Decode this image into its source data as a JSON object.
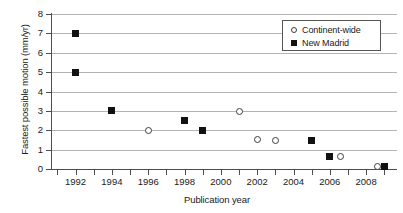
{
  "chart_data": {
    "type": "scatter",
    "title": "",
    "xlabel": "Publication year",
    "ylabel": "Fastest possible motion (mm/yr)",
    "xlim": [
      1990.7,
      2009.7
    ],
    "ylim": [
      0,
      8
    ],
    "grid": true,
    "legend_position": "top-right",
    "y_ticks": [
      0,
      1,
      2,
      3,
      4,
      5,
      6,
      7,
      8
    ],
    "y_tick_labels": [
      "0",
      "1",
      "2",
      "3",
      "4",
      "5",
      "6",
      "7",
      "8"
    ],
    "x_ticks": [
      1992,
      1994,
      1996,
      1998,
      2000,
      2002,
      2004,
      2006,
      2008
    ],
    "x_tick_labels": [
      "1992",
      "1994",
      "1996",
      "1998",
      "2000",
      "2002",
      "2004",
      "2006",
      "2008"
    ],
    "x_minor_ticks": [
      1991,
      1993,
      1995,
      1997,
      1999,
      2001,
      2003,
      2005,
      2007,
      2009
    ],
    "series": [
      {
        "name": "Continent-wide",
        "marker": "open-circle",
        "color": "#3c3c3c",
        "points": [
          {
            "x": 1996,
            "y": 2.0
          },
          {
            "x": 2001,
            "y": 2.95
          },
          {
            "x": 2002,
            "y": 1.5
          },
          {
            "x": 2003,
            "y": 1.48
          },
          {
            "x": 2006.6,
            "y": 0.65
          },
          {
            "x": 2008.6,
            "y": 0.15
          }
        ]
      },
      {
        "name": "New Madrid",
        "marker": "filled-square",
        "color": "#111111",
        "points": [
          {
            "x": 1992,
            "y": 7.0
          },
          {
            "x": 1992,
            "y": 5.0
          },
          {
            "x": 1994,
            "y": 3.0
          },
          {
            "x": 1998,
            "y": 2.5
          },
          {
            "x": 1999,
            "y": 2.0
          },
          {
            "x": 2005,
            "y": 1.45
          },
          {
            "x": 2006,
            "y": 0.65
          },
          {
            "x": 2009,
            "y": 0.12
          }
        ]
      }
    ],
    "legend": [
      {
        "label": "Continent-wide",
        "marker": "open-circle"
      },
      {
        "label": "New Madrid",
        "marker": "filled-square"
      }
    ]
  }
}
